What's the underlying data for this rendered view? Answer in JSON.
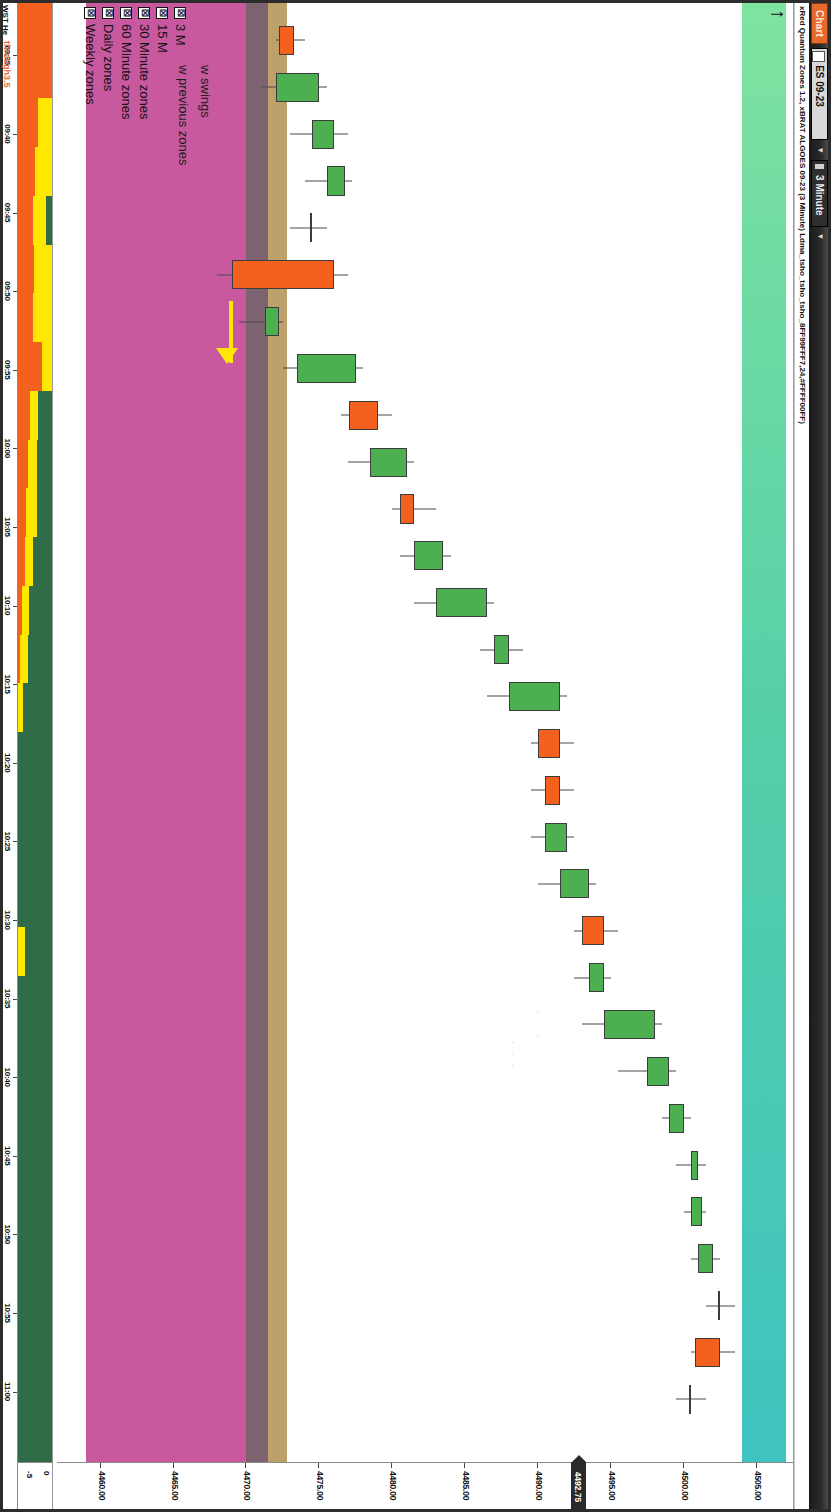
{
  "window": {
    "chart_button_label": "Chart",
    "symbol": "ES 09-23",
    "timeframe": "3 Minute",
    "dropdown_caret": "▼",
    "subtitle": "xRed Quantum Zones 1.2, xBRAT ALGOES 09-23 (3 Minute) Ldma_tsho_tsho_tsho_8FF99FFF7,24,#FFFF00FF)"
  },
  "notes": {
    "line1": "w swings",
    "line2": "w previous zones"
  },
  "legend": {
    "checkbox_glyph": "☒",
    "items": [
      {
        "label": "3 Minute zones",
        "visible_label": "3 M",
        "checked": true
      },
      {
        "label": "15 Minute zones",
        "visible_label": "15 M",
        "checked": true
      },
      {
        "label": "30 Minute zones",
        "visible_label": "30 Minute zones",
        "checked": true
      },
      {
        "label": "60 Minute zones",
        "visible_label": "60 Minute zones",
        "checked": true
      },
      {
        "label": "Daily zones",
        "visible_label": "Daily zones",
        "checked": true
      },
      {
        "label": "Weekly zones",
        "visible_label": "Weekly zones",
        "checked": true
      }
    ]
  },
  "price_axis": {
    "ticks": [
      "4505.00",
      "4500.00",
      "4495.00",
      "4490.00",
      "4485.00",
      "4480.00",
      "4475.00",
      "4470.00",
      "4465.00",
      "4460.00"
    ],
    "last_price_marker": "4492.75",
    "min": 4457.0,
    "max": 4507.5
  },
  "time_axis": {
    "ticks": [
      "09:35",
      "09:40",
      "09:45",
      "09:50",
      "09:55",
      "10:00",
      "10:05",
      "10:10",
      "10:15",
      "10:20",
      "10:25",
      "10:30",
      "10:35",
      "10:40",
      "10:45",
      "10:50",
      "10:55",
      "11:00"
    ]
  },
  "subpanel": {
    "name": "WST He",
    "secondary_label": "through3.5",
    "axis_ticks": [
      "0",
      "-5"
    ],
    "colors": {
      "green": "#2f6b47",
      "yellow": "#ffe800",
      "orange": "#f4601e"
    }
  },
  "colors": {
    "up_candle": "#4caf50",
    "down_candle": "#f4601e",
    "wick": "#4a4a4a",
    "zone_weekly": "#c8599f",
    "zone_daily": "#7d6370",
    "zone_60m": "#bda06a",
    "zone_30m_gradient_start": "#7fe3a0",
    "zone_30m_gradient_end": "#3fc3c0",
    "arrow": "#ffe800",
    "title_bar": "#2b2b2b",
    "chart_button": "#e8672a"
  },
  "chart_data": {
    "type": "candlestick",
    "title": "xRed Quantum Zones 1.2, xBRAT ALGOES 09-23 (3 Minute)",
    "xlabel": "Time",
    "ylabel": "Price",
    "ylim": [
      4457.0,
      4507.5
    ],
    "instrument": "ES 09-23",
    "interval": "3 Minute",
    "candles": [
      {
        "t": "09:33",
        "o": 4473.25,
        "h": 4474.0,
        "l": 4472.0,
        "c": 4472.25,
        "dir": "down"
      },
      {
        "t": "09:36",
        "o": 4472.0,
        "h": 4475.5,
        "l": 4471.0,
        "c": 4475.0,
        "dir": "up"
      },
      {
        "t": "09:39",
        "o": 4474.5,
        "h": 4477.0,
        "l": 4473.0,
        "c": 4476.0,
        "dir": "up"
      },
      {
        "t": "09:42",
        "o": 4475.5,
        "h": 4477.25,
        "l": 4474.0,
        "c": 4476.75,
        "dir": "up"
      },
      {
        "t": "09:45",
        "o": 4474.5,
        "h": 4475.5,
        "l": 4473.0,
        "c": 4474.5,
        "dir": "doji"
      },
      {
        "t": "09:48",
        "o": 4476.0,
        "h": 4477.0,
        "l": 4468.0,
        "c": 4469.0,
        "dir": "down"
      },
      {
        "t": "09:51",
        "o": 4471.25,
        "h": 4472.5,
        "l": 4469.5,
        "c": 4472.25,
        "dir": "up"
      },
      {
        "t": "09:54",
        "o": 4473.5,
        "h": 4478.0,
        "l": 4472.5,
        "c": 4477.5,
        "dir": "up"
      },
      {
        "t": "09:57",
        "o": 4479.0,
        "h": 4480.0,
        "l": 4476.5,
        "c": 4477.0,
        "dir": "down"
      },
      {
        "t": "10:00",
        "o": 4478.5,
        "h": 4481.5,
        "l": 4477.0,
        "c": 4481.0,
        "dir": "up"
      },
      {
        "t": "10:03",
        "o": 4481.5,
        "h": 4483.0,
        "l": 4480.0,
        "c": 4480.5,
        "dir": "down"
      },
      {
        "t": "10:06",
        "o": 4481.5,
        "h": 4484.0,
        "l": 4480.5,
        "c": 4483.5,
        "dir": "up"
      },
      {
        "t": "10:09",
        "o": 4483.0,
        "h": 4487.0,
        "l": 4481.5,
        "c": 4486.5,
        "dir": "up"
      },
      {
        "t": "10:12",
        "o": 4487.0,
        "h": 4489.0,
        "l": 4486.0,
        "c": 4488.0,
        "dir": "up"
      },
      {
        "t": "10:15",
        "o": 4488.0,
        "h": 4492.0,
        "l": 4486.5,
        "c": 4491.5,
        "dir": "up"
      },
      {
        "t": "10:18",
        "o": 4491.5,
        "h": 4492.5,
        "l": 4489.5,
        "c": 4490.0,
        "dir": "down"
      },
      {
        "t": "10:21",
        "o": 4491.5,
        "h": 4492.5,
        "l": 4489.5,
        "c": 4490.5,
        "dir": "down"
      },
      {
        "t": "10:24",
        "o": 4490.5,
        "h": 4492.5,
        "l": 4489.5,
        "c": 4492.0,
        "dir": "up"
      },
      {
        "t": "10:27",
        "o": 4491.5,
        "h": 4494.0,
        "l": 4490.0,
        "c": 4493.5,
        "dir": "up"
      },
      {
        "t": "10:30",
        "o": 4494.5,
        "h": 4495.5,
        "l": 4492.5,
        "c": 4493.0,
        "dir": "down"
      },
      {
        "t": "10:33",
        "o": 4493.5,
        "h": 4495.0,
        "l": 4492.5,
        "c": 4494.5,
        "dir": "up"
      },
      {
        "t": "10:36",
        "o": 4494.5,
        "h": 4498.5,
        "l": 4493.0,
        "c": 4498.0,
        "dir": "up"
      },
      {
        "t": "10:39",
        "o": 4497.5,
        "h": 4499.5,
        "l": 4495.5,
        "c": 4499.0,
        "dir": "up"
      },
      {
        "t": "10:42",
        "o": 4499.0,
        "h": 4500.5,
        "l": 4498.5,
        "c": 4500.0,
        "dir": "up"
      },
      {
        "t": "10:45",
        "o": 4500.5,
        "h": 4501.5,
        "l": 4499.5,
        "c": 4501.0,
        "dir": "up"
      },
      {
        "t": "10:48",
        "o": 4500.5,
        "h": 4501.5,
        "l": 4500.0,
        "c": 4501.25,
        "dir": "up"
      },
      {
        "t": "10:51",
        "o": 4501.0,
        "h": 4502.5,
        "l": 4500.5,
        "c": 4502.0,
        "dir": "up"
      },
      {
        "t": "10:54",
        "o": 4502.5,
        "h": 4503.5,
        "l": 4501.5,
        "c": 4502.5,
        "dir": "up"
      },
      {
        "t": "10:57",
        "o": 4502.5,
        "h": 4503.5,
        "l": 4500.5,
        "c": 4500.75,
        "dir": "down"
      },
      {
        "t": "11:00",
        "o": 4500.5,
        "h": 4501.5,
        "l": 4499.5,
        "c": 4500.5,
        "dir": "down"
      }
    ],
    "zones": [
      {
        "name": "Weekly zones",
        "top": 4470.0,
        "bottom": 4459.0,
        "color": "#c8599f"
      },
      {
        "name": "Daily zones",
        "top": 4471.5,
        "bottom": 4470.0,
        "color": "#7d6370"
      },
      {
        "name": "60 Minute zones",
        "top": 4472.75,
        "bottom": 4471.5,
        "color": "#bda06a"
      },
      {
        "name": "30 Minute zones",
        "top": 4507.0,
        "bottom": 4504.0,
        "color": "gradient"
      }
    ],
    "annotations": [
      {
        "type": "arrow",
        "direction": "right",
        "at_time": "09:45",
        "color": "#ffe800"
      },
      {
        "type": "arrow",
        "direction": "up",
        "at_time": "11:00",
        "color": "#111111"
      }
    ]
  }
}
